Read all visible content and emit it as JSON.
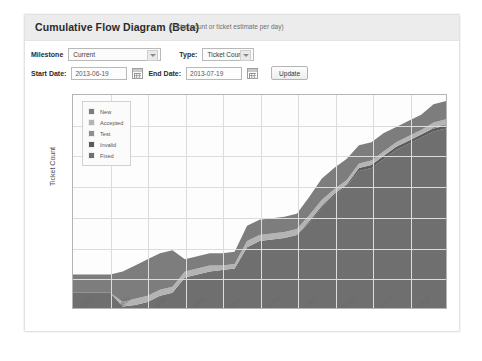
{
  "card": {
    "title": "Cumulative Flow Diagram (Beta)",
    "subtitle": "(Ticket count or ticket estimate per day)"
  },
  "form": {
    "milestone_label": "Milestone",
    "milestone_value": "Current",
    "milestone_options": [
      "Current"
    ],
    "type_label": "Type:",
    "type_value": "Ticket Count",
    "type_options": [
      "Ticket Count"
    ],
    "start_date_label": "Start Date:",
    "start_date_value": "2013-06-19",
    "end_date_label": "End Date:",
    "end_date_value": "2013-07-19",
    "update_label": "Update",
    "calendar_icon": "calendar-icon",
    "dropdown_icon": "chevron-down-icon"
  },
  "chart_data": {
    "type": "area",
    "title": "",
    "xlabel": "",
    "ylabel": "Ticket Count",
    "ylim": [
      0,
      140
    ],
    "yticks": [
      0,
      20,
      40,
      60,
      80,
      100,
      120,
      140
    ],
    "grid": true,
    "legend_position": "top-left",
    "stacked": true,
    "x": [
      "2013/06/19",
      "2013/06/20",
      "2013/06/21",
      "2013/06/22",
      "2013/06/23",
      "2013/06/24",
      "2013/06/25",
      "2013/06/26",
      "2013/06/27",
      "2013/06/28",
      "2013/06/29",
      "2013/06/30",
      "2013/07/01",
      "2013/07/02",
      "2013/07/03",
      "2013/07/04",
      "2013/07/05",
      "2013/07/06",
      "2013/07/07",
      "2013/07/08",
      "2013/07/09",
      "2013/07/10",
      "2013/07/11",
      "2013/07/12",
      "2013/07/13",
      "2013/07/14",
      "2013/07/15",
      "2013/07/16",
      "2013/07/17",
      "2013/07/18",
      "2013/07/19"
    ],
    "xticks": [
      "2013/06/19",
      "2013/06/22",
      "2013/06/25",
      "2013/06/28",
      "2013/07/01",
      "2013/07/04",
      "2013/07/07",
      "2013/07/10",
      "2013/07/13",
      "2013/07/16",
      "2013/07/19"
    ],
    "series": [
      {
        "name": "Fixed",
        "color": "#6f6f6f",
        "values": [
          10,
          10,
          10,
          10,
          1,
          2,
          4,
          8,
          10,
          20,
          22,
          24,
          25,
          26,
          40,
          44,
          45,
          46,
          48,
          56,
          66,
          74,
          80,
          90,
          92,
          98,
          104,
          108,
          112,
          116,
          118
        ]
      },
      {
        "name": "Invalid",
        "color": "#5a5a5a",
        "values": [
          0,
          0,
          0,
          0,
          0,
          0,
          0,
          0,
          0,
          0,
          0,
          0,
          0,
          0,
          0,
          0,
          0,
          0,
          0,
          1,
          1,
          1,
          1,
          2,
          2,
          2,
          2,
          2,
          2,
          2,
          2
        ]
      },
      {
        "name": "Test",
        "color": "#8f8f8f",
        "values": [
          0,
          0,
          0,
          0,
          0,
          0,
          0,
          0,
          0,
          0,
          0,
          0,
          0,
          0,
          0,
          0,
          0,
          0,
          0,
          0,
          0,
          0,
          0,
          0,
          0,
          0,
          0,
          0,
          0,
          1,
          1
        ]
      },
      {
        "name": "Accepted",
        "color": "#b4b4b4",
        "values": [
          0,
          0,
          0,
          0,
          3,
          4,
          4,
          4,
          4,
          4,
          4,
          4,
          3,
          3,
          4,
          4,
          4,
          4,
          4,
          4,
          4,
          3,
          3,
          3,
          3,
          3,
          3,
          3,
          3,
          3,
          3
        ]
      },
      {
        "name": "New",
        "color": "#7d7d7d",
        "values": [
          12,
          12,
          12,
          12,
          20,
          22,
          24,
          24,
          24,
          8,
          8,
          8,
          8,
          8,
          10,
          10,
          10,
          10,
          10,
          12,
          14,
          14,
          14,
          12,
          12,
          12,
          10,
          10,
          10,
          12,
          12
        ]
      }
    ]
  }
}
